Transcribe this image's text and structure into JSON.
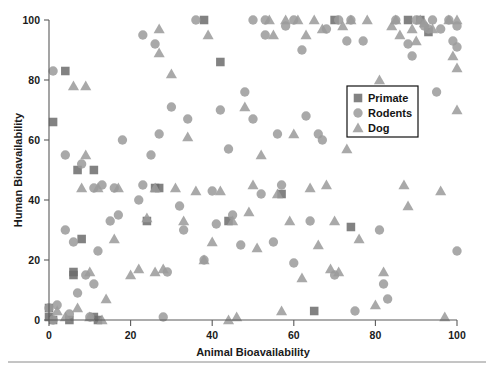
{
  "figure": {
    "background": "#ffffff",
    "width": 494,
    "height": 378
  },
  "chart_data": {
    "type": "scatter",
    "title": "",
    "xlabel": "Animal Bioavailability",
    "ylabel": "Human Bioavailability",
    "xlim": [
      0,
      100
    ],
    "ylim": [
      0,
      100
    ],
    "xticks": [
      0,
      20,
      40,
      60,
      80,
      100
    ],
    "yticks": [
      0,
      20,
      40,
      60,
      80,
      100
    ],
    "xtick_labels": [
      "0",
      "20",
      "40",
      "60",
      "80",
      "100"
    ],
    "ytick_labels": [
      "0",
      "20",
      "40",
      "60",
      "80",
      "100"
    ],
    "grid": false,
    "legend_position": "center-right",
    "legend_entries": [
      {
        "label": "Primate",
        "marker": "square",
        "color": "#6e6e6e"
      },
      {
        "label": "Rodents",
        "marker": "circle",
        "color": "#9b9b9b"
      },
      {
        "label": "Dog",
        "marker": "triangle",
        "color": "#9b9b9b"
      }
    ],
    "series": [
      {
        "name": "Primate",
        "marker": "square",
        "color": "#6e6e6e",
        "points": [
          [
            0,
            4
          ],
          [
            0,
            1
          ],
          [
            1,
            0
          ],
          [
            4,
            83
          ],
          [
            5,
            0
          ],
          [
            6,
            15
          ],
          [
            6,
            16
          ],
          [
            7,
            50
          ],
          [
            8,
            27
          ],
          [
            11,
            50
          ],
          [
            11,
            1
          ],
          [
            12,
            0
          ],
          [
            1,
            66
          ],
          [
            24,
            33
          ],
          [
            26,
            44
          ],
          [
            27,
            44
          ],
          [
            38,
            100
          ],
          [
            42,
            86
          ],
          [
            44,
            33
          ],
          [
            57,
            42
          ],
          [
            65,
            3
          ],
          [
            70,
            100
          ],
          [
            74,
            31
          ],
          [
            88,
            100
          ],
          [
            91,
            100
          ],
          [
            93,
            96
          ]
        ]
      },
      {
        "name": "Rodents",
        "marker": "circle",
        "color": "#9b9b9b",
        "points": [
          [
            0,
            4
          ],
          [
            1,
            0
          ],
          [
            1,
            83
          ],
          [
            2,
            5
          ],
          [
            4,
            30
          ],
          [
            4,
            55
          ],
          [
            5,
            2
          ],
          [
            6,
            26
          ],
          [
            7,
            9
          ],
          [
            8,
            52
          ],
          [
            9,
            15
          ],
          [
            10,
            1
          ],
          [
            11,
            44
          ],
          [
            11,
            12
          ],
          [
            12,
            23
          ],
          [
            13,
            45
          ],
          [
            15,
            33
          ],
          [
            16,
            44
          ],
          [
            17,
            35
          ],
          [
            18,
            60
          ],
          [
            22,
            40
          ],
          [
            23,
            95
          ],
          [
            23,
            45
          ],
          [
            25,
            55
          ],
          [
            26,
            92
          ],
          [
            27,
            62
          ],
          [
            28,
            1
          ],
          [
            29,
            16
          ],
          [
            30,
            71
          ],
          [
            32,
            38
          ],
          [
            33,
            30
          ],
          [
            34,
            67
          ],
          [
            36,
            100
          ],
          [
            38,
            20
          ],
          [
            40,
            43
          ],
          [
            41,
            32
          ],
          [
            42,
            70
          ],
          [
            44,
            57
          ],
          [
            45,
            35
          ],
          [
            47,
            25
          ],
          [
            48,
            76
          ],
          [
            50,
            67
          ],
          [
            50,
            100
          ],
          [
            52,
            42
          ],
          [
            53,
            100
          ],
          [
            53,
            95
          ],
          [
            55,
            26
          ],
          [
            56,
            62
          ],
          [
            57,
            45
          ],
          [
            58,
            98
          ],
          [
            60,
            100
          ],
          [
            60,
            19
          ],
          [
            62,
            90
          ],
          [
            63,
            68
          ],
          [
            64,
            33
          ],
          [
            66,
            62
          ],
          [
            67,
            60
          ],
          [
            68,
            97
          ],
          [
            70,
            15
          ],
          [
            71,
            100
          ],
          [
            73,
            93
          ],
          [
            74,
            100
          ],
          [
            75,
            3
          ],
          [
            77,
            93
          ],
          [
            80,
            66
          ],
          [
            81,
            30
          ],
          [
            82,
            12
          ],
          [
            83,
            7
          ],
          [
            85,
            100
          ],
          [
            88,
            92
          ],
          [
            89,
            88
          ],
          [
            90,
            100
          ],
          [
            92,
            98
          ],
          [
            93,
            97
          ],
          [
            94,
            100
          ],
          [
            95,
            76
          ],
          [
            96,
            97
          ],
          [
            98,
            100
          ],
          [
            99,
            93
          ],
          [
            100,
            98
          ],
          [
            100,
            91
          ],
          [
            100,
            23
          ]
        ]
      },
      {
        "name": "Dog",
        "marker": "triangle",
        "color": "#9b9b9b",
        "points": [
          [
            2,
            3
          ],
          [
            4,
            1
          ],
          [
            6,
            78
          ],
          [
            7,
            4
          ],
          [
            8,
            44
          ],
          [
            9,
            78
          ],
          [
            9,
            55
          ],
          [
            10,
            16
          ],
          [
            10,
            1
          ],
          [
            12,
            44
          ],
          [
            13,
            0
          ],
          [
            14,
            7
          ],
          [
            16,
            27
          ],
          [
            17,
            44
          ],
          [
            20,
            15
          ],
          [
            22,
            17
          ],
          [
            24,
            34
          ],
          [
            26,
            16
          ],
          [
            26,
            44
          ],
          [
            27,
            97
          ],
          [
            27,
            89
          ],
          [
            28,
            17
          ],
          [
            30,
            82
          ],
          [
            31,
            44
          ],
          [
            33,
            33
          ],
          [
            34,
            61
          ],
          [
            36,
            43
          ],
          [
            38,
            20
          ],
          [
            39,
            95
          ],
          [
            40,
            26
          ],
          [
            42,
            43
          ],
          [
            44,
            0
          ],
          [
            45,
            33
          ],
          [
            46,
            1
          ],
          [
            48,
            71
          ],
          [
            49,
            36
          ],
          [
            50,
            45
          ],
          [
            51,
            24
          ],
          [
            52,
            55
          ],
          [
            54,
            100
          ],
          [
            55,
            95
          ],
          [
            56,
            42
          ],
          [
            57,
            3
          ],
          [
            58,
            100
          ],
          [
            59,
            33
          ],
          [
            60,
            62
          ],
          [
            61,
            100
          ],
          [
            62,
            14
          ],
          [
            63,
            95
          ],
          [
            64,
            44
          ],
          [
            65,
            100
          ],
          [
            66,
            25
          ],
          [
            67,
            97
          ],
          [
            68,
            45
          ],
          [
            69,
            17
          ],
          [
            70,
            33
          ],
          [
            71,
            16
          ],
          [
            72,
            98
          ],
          [
            73,
            57
          ],
          [
            74,
            100
          ],
          [
            76,
            27
          ],
          [
            78,
            100
          ],
          [
            80,
            5
          ],
          [
            81,
            80
          ],
          [
            82,
            16
          ],
          [
            84,
            98
          ],
          [
            85,
            100
          ],
          [
            86,
            95
          ],
          [
            87,
            45
          ],
          [
            88,
            38
          ],
          [
            89,
            97
          ],
          [
            90,
            93
          ],
          [
            91,
            100
          ],
          [
            92,
            99
          ],
          [
            94,
            97
          ],
          [
            96,
            43
          ],
          [
            97,
            1
          ],
          [
            98,
            100
          ],
          [
            99,
            88
          ],
          [
            100,
            100
          ],
          [
            100,
            84
          ],
          [
            100,
            70
          ]
        ]
      }
    ]
  },
  "axes": {
    "line_color": "#5a5a5a",
    "x_label_text": "Animal Bioavailability",
    "y_label_text": "Human Bioavailability"
  },
  "legend": {
    "items": [
      {
        "label": "Primate"
      },
      {
        "label": "Rodents"
      },
      {
        "label": "Dog"
      }
    ]
  }
}
